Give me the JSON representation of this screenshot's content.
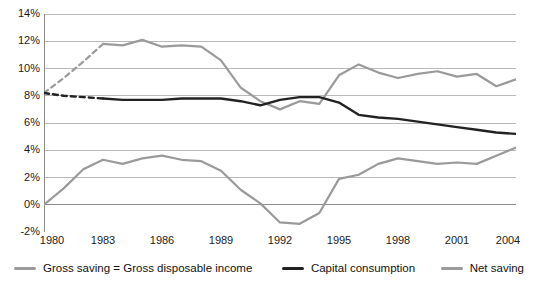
{
  "chart_data": {
    "type": "line",
    "title": "",
    "subtitle": "",
    "xlabel": "",
    "ylabel": "",
    "xlim": [
      1980,
      2004
    ],
    "ylim": [
      -2,
      14
    ],
    "grid": true,
    "legend_position": "bottom",
    "y_ticks": [
      "-2%",
      "0%",
      "2%",
      "4%",
      "6%",
      "8%",
      "10%",
      "12%",
      "14%"
    ],
    "y_tick_values": [
      -2,
      0,
      2,
      4,
      6,
      8,
      10,
      12,
      14
    ],
    "x_ticks": [
      "1980",
      "1983",
      "1986",
      "1989",
      "1992",
      "1995",
      "1998",
      "2001",
      "2004"
    ],
    "x_tick_values": [
      1980,
      1983,
      1986,
      1989,
      1992,
      1995,
      1998,
      2001,
      2004
    ],
    "x": [
      1980,
      1981,
      1982,
      1983,
      1984,
      1985,
      1986,
      1987,
      1988,
      1989,
      1990,
      1991,
      1992,
      1993,
      1994,
      1995,
      1996,
      1997,
      1998,
      1999,
      2000,
      2001,
      2002,
      2003,
      2004
    ],
    "series": [
      {
        "name": "Gross saving = Gross disposable income",
        "color": "#9a9a9a",
        "width": 2.2,
        "dashed_segment": {
          "from_year": 1980,
          "to_year": 1983,
          "note": "dashed between 1980 and 1983"
        },
        "values": [
          8.2,
          9.3,
          10.5,
          11.8,
          11.7,
          12.1,
          11.6,
          11.7,
          11.6,
          10.6,
          8.6,
          7.6,
          7.0,
          7.6,
          7.4,
          9.5,
          10.3,
          9.7,
          9.3,
          9.6,
          9.8,
          9.4,
          9.6,
          8.7,
          9.2
        ]
      },
      {
        "name": "Capital consumption",
        "color": "#222222",
        "width": 2.4,
        "dashed_segment": {
          "from_year": 1980,
          "to_year": 1983,
          "note": "dashed between 1980 and 1983"
        },
        "values": [
          8.2,
          8.0,
          7.9,
          7.8,
          7.7,
          7.7,
          7.7,
          7.8,
          7.8,
          7.8,
          7.6,
          7.3,
          7.7,
          7.9,
          7.9,
          7.5,
          6.6,
          6.4,
          6.3,
          6.1,
          5.9,
          5.7,
          5.5,
          5.3,
          5.2
        ]
      },
      {
        "name": "Net saving",
        "color": "#9a9a9a",
        "width": 2.2,
        "values": [
          0.0,
          1.2,
          2.6,
          3.3,
          3.0,
          3.4,
          3.6,
          3.3,
          3.2,
          2.5,
          1.1,
          0.1,
          -1.3,
          -1.4,
          -0.6,
          1.9,
          2.2,
          3.0,
          3.4,
          3.2,
          3.0,
          3.1,
          3.0,
          3.6,
          4.2
        ]
      }
    ]
  },
  "legend": {
    "items": [
      {
        "label": "Gross saving = Gross disposable income",
        "color": "#9a9a9a"
      },
      {
        "label": "Capital consumption",
        "color": "#222222"
      },
      {
        "label": "Net saving",
        "color": "#9a9a9a"
      }
    ]
  }
}
